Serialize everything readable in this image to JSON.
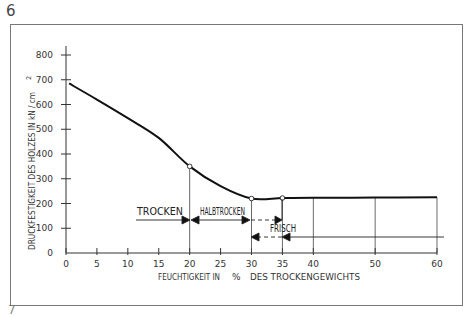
{
  "page": {
    "figure_number_top": "6",
    "figure_number_bottom": "7"
  },
  "chart_data": {
    "type": "line",
    "title": "",
    "xlabel": "FEUCHTIGKEIT IN % DES TROCKENGEWICHTS",
    "ylabel": "DRUCKFESTIGKEIT DES HOLZES IN kN/cm²",
    "xlim": [
      0,
      60
    ],
    "ylim": [
      0,
      800
    ],
    "x_ticks": [
      0,
      5,
      10,
      15,
      20,
      25,
      30,
      35,
      40,
      50,
      60
    ],
    "x_tick_labels": [
      "0",
      "5",
      "10",
      "15",
      "20",
      "25",
      "30",
      "35",
      "40",
      "50",
      "60"
    ],
    "y_ticks": [
      0,
      100,
      200,
      300,
      400,
      500,
      600,
      700,
      800
    ],
    "y_tick_labels": [
      "0",
      "100",
      "200",
      "300",
      "400",
      "500",
      "600",
      "700",
      "800"
    ],
    "grid": false,
    "legend": null,
    "series": [
      {
        "name": "Druckfestigkeit",
        "x": [
          0.5,
          5,
          10,
          15,
          20,
          25,
          30,
          35,
          40,
          50,
          60
        ],
        "y": [
          685,
          620,
          545,
          465,
          350,
          270,
          220,
          222,
          223,
          224,
          225
        ]
      }
    ],
    "markers": [
      {
        "x": 20,
        "y": 350
      },
      {
        "x": 30,
        "y": 220
      },
      {
        "x": 35,
        "y": 222
      }
    ],
    "vertical_lines_x": [
      20,
      30,
      35,
      40,
      50,
      60
    ],
    "annotations": [
      {
        "label": "TROCKEN",
        "range": [
          0,
          20
        ],
        "y": 120,
        "style": "solid arrow ending at 20"
      },
      {
        "label": "HALBTROCKEN",
        "range": [
          20,
          30
        ],
        "y": 120,
        "style": "double arrow 20–30, dashed extension to 35"
      },
      {
        "label": "FRISCH",
        "range": [
          30,
          60
        ],
        "y": 60,
        "style": "solid arrow from 60 to 35, dashed extension to 30"
      }
    ]
  },
  "labels": {
    "ylabel": "DRUCKFESTIGKEIT  DES  HOLZES  IN  kN / cm",
    "ylabel_sup": "2",
    "xlabel_part1": "FEUCHTIGKEIT  IN",
    "xlabel_pct": "%",
    "xlabel_part2": "DES   TROCKENGEWICHTS",
    "trocken": "TROCKEN",
    "halbtrocken": "HALBTROCKEN",
    "frisch": "FRISCH"
  }
}
